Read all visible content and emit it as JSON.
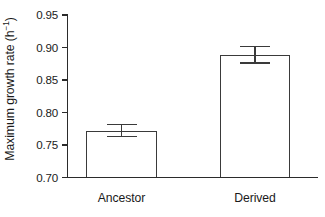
{
  "chart_data": {
    "type": "bar",
    "title": "",
    "subtitle": "",
    "xlabel": "",
    "ylabel": "Maximum growth rate (h",
    "ylabel_exponent": "−1",
    "ylabel_suffix": ")",
    "ylabel_full": "Maximum growth rate (h⁻¹)",
    "categories": [
      "Ancestor",
      "Derived"
    ],
    "values": [
      0.772,
      0.888
    ],
    "errors_upper": [
      0.782,
      0.901
    ],
    "errors_lower": [
      0.763,
      0.876
    ],
    "error_plus": [
      0.01,
      0.013
    ],
    "error_minus": [
      0.009,
      0.012
    ],
    "ylim": [
      0.7,
      0.95
    ],
    "ytick_labels": [
      "0.95",
      "0.90",
      "0.85",
      "0.80",
      "0.75",
      "0.70"
    ],
    "ytick_values": [
      0.95,
      0.9,
      0.85,
      0.8,
      0.75,
      0.7
    ],
    "grid": false,
    "legend": "none",
    "bar_fill_color": "#ffffff",
    "bar_edge_color": "#3a3a3a",
    "axis_color": "#2b2b2b",
    "text_color": "#1a1a1a",
    "background_color": "#ffffff"
  }
}
